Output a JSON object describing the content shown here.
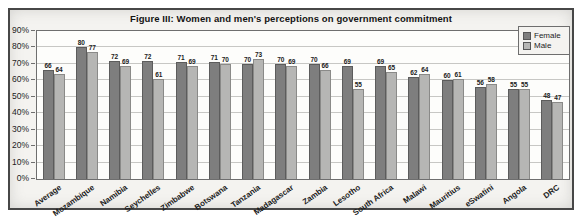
{
  "figure_title": "Figure III: Women and men's perceptions on government commitment",
  "chart_data": {
    "type": "bar",
    "title": "Figure III: Women and men's perceptions on government commitment",
    "categories": [
      "Average",
      "Mozambique",
      "Namibia",
      "Seychelles",
      "Zimbabwe",
      "Botswana",
      "Tanzania",
      "Madagascar",
      "Zambia",
      "Lesotho",
      "South Africa",
      "Malawi",
      "Mauritius",
      "eSwatini",
      "Angola",
      "DRC"
    ],
    "series": [
      {
        "name": "Female",
        "color": "#7e7e7e",
        "values": [
          66,
          80,
          72,
          72,
          71,
          71,
          70,
          70,
          70,
          69,
          69,
          62,
          60,
          56,
          55,
          48
        ]
      },
      {
        "name": "Male",
        "color": "#b6b6b4",
        "values": [
          64,
          77,
          69,
          61,
          69,
          70,
          73,
          69,
          66,
          55,
          65,
          64,
          61,
          58,
          55,
          47
        ]
      }
    ],
    "xlabel": "",
    "ylabel": "",
    "ylim": [
      0,
      90
    ],
    "y_ticks": [
      "0%",
      "10%",
      "20%",
      "30%",
      "40%",
      "50%",
      "60%",
      "70%",
      "80%",
      "90%"
    ],
    "grid": true,
    "legend_position": "top-right"
  },
  "colors": {
    "female_bar": "#7e7e7e",
    "male_bar": "#b6b6b4",
    "gridline": "#c7c7c4",
    "plot_border": "#6e6e6e",
    "figure_border": "#474747",
    "figure_background": "#f4f3f0",
    "plot_background": "#fdfdfb",
    "text": "#1c1c1c"
  }
}
